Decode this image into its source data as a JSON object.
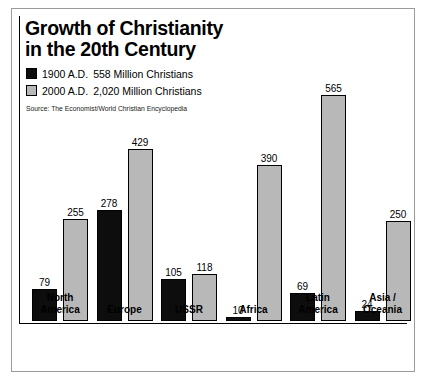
{
  "chart_data": {
    "type": "bar",
    "title": "Growth of Christianity in the 20th Century",
    "title_lines": [
      "Growth of Christianity",
      "in the 20th Century"
    ],
    "source": "Source: The Economist/World Christian Encyclopedia",
    "xlabel": "",
    "ylabel": "",
    "ylim": [
      0,
      565
    ],
    "grid": false,
    "legend_position": "top-left",
    "unit": "Million Christians",
    "categories": [
      "North America",
      "Europe",
      "USSR",
      "Africa",
      "Latin America",
      "Asia / Oceania"
    ],
    "category_lines": [
      [
        "North",
        "America"
      ],
      [
        "Europe"
      ],
      [
        "USSR"
      ],
      [
        "Africa"
      ],
      [
        "Latin",
        "America"
      ],
      [
        "Asia /",
        "Oceania"
      ]
    ],
    "series": [
      {
        "name": "1900 A.D.",
        "legend_year": "1900 A.D.",
        "legend_text": "558 Million Christians",
        "total": 558,
        "color": "#0d0d0d",
        "values": [
          79,
          278,
          105,
          10,
          69,
          24
        ]
      },
      {
        "name": "2000 A.D.",
        "legend_year": "2000 A.D.",
        "legend_text": "2,020 Million Christians",
        "total": 2020,
        "color": "#b8b8b8",
        "values": [
          255,
          429,
          118,
          390,
          565,
          250
        ]
      }
    ]
  },
  "colors": {
    "series_1900": "#0d0d0d",
    "series_2000": "#b8b8b8",
    "frame": "#9a9a9a",
    "axis": "#000000",
    "background": "#ffffff"
  }
}
